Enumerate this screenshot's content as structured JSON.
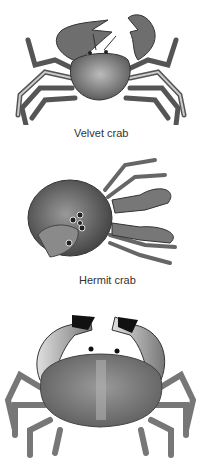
{
  "figures": [
    {
      "name": "velvet-crab",
      "label": "Velvet crab"
    },
    {
      "name": "hermit-crab",
      "label": "Hermit crab"
    },
    {
      "name": "edible-crab",
      "label": ""
    }
  ],
  "colors": {
    "background": "#ffffff",
    "ink": "#333333",
    "shell": "#7a7a7a"
  }
}
